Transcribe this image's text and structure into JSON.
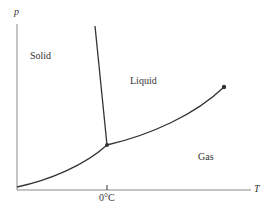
{
  "diagram": {
    "axes": {
      "y_label": "p",
      "x_label": "T",
      "x_tick_label": "0°C"
    },
    "regions": {
      "solid": "Solid",
      "liquid": "Liquid",
      "gas": "Gas"
    },
    "points": {
      "triple_point": [
        107,
        145
      ],
      "critical_point": [
        224,
        87
      ]
    },
    "colors": {
      "axis": "#888888",
      "curve": "#333333"
    }
  }
}
